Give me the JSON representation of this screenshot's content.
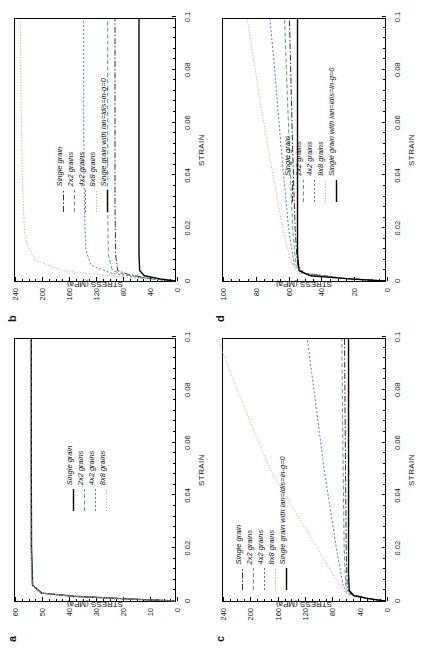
{
  "figure": {
    "orientation": "rotated-90-ccw",
    "panels": [
      "a",
      "b",
      "c",
      "d"
    ]
  },
  "series_styles": {
    "single_grain_solid": {
      "color": "#000000",
      "dash": "none",
      "width": 1.4
    },
    "single_grain_dashdot": {
      "color": "#1a1a1a",
      "dash": "6,2,1.5,2",
      "width": 0.9
    },
    "grains_2x2": {
      "color": "#2f9e5e",
      "dash": "4,2.5",
      "width": 0.9
    },
    "grains_4x2": {
      "color": "#4169c8",
      "dash": "2,2",
      "width": 0.9
    },
    "grains_8x8": {
      "color": "#e8948c",
      "dash": "1.2,1.6",
      "width": 0.9
    },
    "reference_solid": {
      "color": "#000000",
      "dash": "none",
      "width": 1.4
    }
  },
  "chart_data": [
    {
      "panel": "a",
      "type": "line",
      "title": "",
      "xlabel": "STRAIN",
      "ylabel": "STRESS (MPa)",
      "xlim": [
        0,
        0.1
      ],
      "ylim": [
        0,
        60
      ],
      "xticks": [
        0,
        0.02,
        0.04,
        0.06,
        0.08,
        0.1
      ],
      "xticklabels": [
        "0",
        "0.02",
        "0.04",
        "0.06",
        "0.08",
        "0.1"
      ],
      "yticks": [
        0,
        10,
        20,
        30,
        40,
        50,
        60
      ],
      "yticklabels": [
        "0",
        "10",
        "20",
        "30",
        "40",
        "50",
        "60"
      ],
      "grid": false,
      "legend_position": "center",
      "series": [
        {
          "name": "Single grain",
          "style": "single_grain_solid",
          "x": [
            0,
            0.0008,
            0.0018,
            0.003,
            0.006,
            0.02,
            0.05,
            0.08,
            0.1
          ],
          "y": [
            0,
            18,
            38,
            50,
            53.4,
            53.8,
            53.9,
            53.9,
            53.9
          ]
        },
        {
          "name": "2x2 grains",
          "style": "grains_2x2",
          "x": [
            0,
            0.0008,
            0.0018,
            0.003,
            0.006,
            0.02,
            0.05,
            0.08,
            0.1
          ],
          "y": [
            0,
            18,
            38,
            50,
            53.5,
            53.9,
            54.0,
            54.0,
            54.0
          ]
        },
        {
          "name": "4x2 grains",
          "style": "grains_4x2",
          "x": [
            0,
            0.0008,
            0.0018,
            0.003,
            0.006,
            0.02,
            0.05,
            0.08,
            0.1
          ],
          "y": [
            0,
            18,
            38,
            50,
            53.5,
            54.0,
            54.1,
            54.1,
            54.1
          ]
        },
        {
          "name": "8x8 grains",
          "style": "grains_8x8",
          "x": [
            0,
            0.0008,
            0.0018,
            0.003,
            0.006,
            0.02,
            0.05,
            0.08,
            0.1
          ],
          "y": [
            0,
            18,
            38,
            50,
            53.6,
            54.1,
            54.2,
            54.2,
            54.2
          ]
        }
      ]
    },
    {
      "panel": "b",
      "type": "line",
      "title": "",
      "xlabel": "STRAIN",
      "ylabel": "STRESS (MPa)",
      "xlim": [
        0,
        0.1
      ],
      "ylim": [
        0,
        240
      ],
      "xticks": [
        0,
        0.02,
        0.04,
        0.06,
        0.08,
        0.1
      ],
      "xticklabels": [
        "0",
        "0.02",
        "0.04",
        "0.06",
        "0.08",
        "0.1"
      ],
      "yticks": [
        0,
        40,
        80,
        120,
        160,
        200,
        240
      ],
      "yticklabels": [
        "0",
        "40",
        "80",
        "120",
        "160",
        "200",
        "240"
      ],
      "grid": false,
      "legend_position": "center-left",
      "series": [
        {
          "name": "Single grain",
          "style": "single_grain_dashdot",
          "x": [
            0,
            0.001,
            0.0025,
            0.004,
            0.01,
            0.03,
            0.06,
            0.1
          ],
          "y": [
            0,
            40,
            70,
            86,
            89,
            90,
            90,
            90
          ]
        },
        {
          "name": "2x2 grains",
          "style": "grains_2x2",
          "x": [
            0,
            0.001,
            0.0025,
            0.004,
            0.01,
            0.03,
            0.06,
            0.1
          ],
          "y": [
            0,
            42,
            76,
            94,
            100,
            101,
            101,
            101
          ]
        },
        {
          "name": "4x2 grains",
          "style": "grains_4x2",
          "x": [
            0,
            0.001,
            0.003,
            0.006,
            0.012,
            0.03,
            0.06,
            0.1
          ],
          "y": [
            0,
            46,
            96,
            126,
            134,
            136,
            137,
            137
          ]
        },
        {
          "name": "8x8 grains",
          "style": "grains_8x8",
          "x": [
            0,
            0.0015,
            0.004,
            0.008,
            0.014,
            0.02,
            0.04,
            0.07,
            0.1
          ],
          "y": [
            0,
            80,
            170,
            210,
            222,
            226,
            229,
            231,
            232
          ]
        },
        {
          "name": "Single grain with lan=ldis=ln-g=0",
          "style": "reference_solid",
          "x": [
            0,
            0.0008,
            0.002,
            0.004,
            0.01,
            0.05,
            0.1
          ],
          "y": [
            0,
            22,
            46,
            53,
            54,
            54,
            54
          ]
        }
      ]
    },
    {
      "panel": "c",
      "type": "line",
      "title": "",
      "xlabel": "STRAIN",
      "ylabel": "STRESS (MPa)",
      "xlim": [
        0,
        0.1
      ],
      "ylim": [
        0,
        240
      ],
      "xticks": [
        0,
        0.02,
        0.04,
        0.06,
        0.08,
        0.1
      ],
      "xticklabels": [
        "0",
        "0.02",
        "0.04",
        "0.06",
        "0.08",
        "0.1"
      ],
      "yticks": [
        0,
        40,
        80,
        120,
        160,
        200,
        240
      ],
      "yticklabels": [
        "0",
        "40",
        "80",
        "120",
        "160",
        "200",
        "240"
      ],
      "grid": false,
      "legend_position": "upper-left",
      "series": [
        {
          "name": "Single grain",
          "style": "single_grain_dashdot",
          "x": [
            0,
            0.001,
            0.0025,
            0.005,
            0.02,
            0.05,
            0.1
          ],
          "y": [
            0,
            25,
            50,
            56,
            57.5,
            58.5,
            60
          ]
        },
        {
          "name": "2x2 grains",
          "style": "grains_2x2",
          "x": [
            0,
            0.001,
            0.0025,
            0.005,
            0.02,
            0.05,
            0.1
          ],
          "y": [
            0,
            26,
            52,
            58,
            60.5,
            62,
            64
          ]
        },
        {
          "name": "4x2 grains",
          "style": "grains_4x2",
          "x": [
            0,
            0.001,
            0.0028,
            0.006,
            0.02,
            0.05,
            0.08,
            0.1
          ],
          "y": [
            0,
            28,
            56,
            62,
            72,
            90,
            105,
            115
          ]
        },
        {
          "name": "8x8 grains",
          "style": "grains_8x8",
          "x": [
            0,
            0.0012,
            0.003,
            0.008,
            0.02,
            0.05,
            0.08,
            0.1
          ],
          "y": [
            0,
            30,
            58,
            72,
            100,
            170,
            218,
            248
          ]
        },
        {
          "name": "Single grain with lan=ldis=ln-g=0",
          "style": "reference_solid",
          "x": [
            0,
            0.0008,
            0.002,
            0.004,
            0.01,
            0.05,
            0.1
          ],
          "y": [
            0,
            22,
            46,
            53,
            54,
            54,
            54
          ]
        }
      ]
    },
    {
      "panel": "d",
      "type": "line",
      "title": "",
      "xlabel": "STRAIN",
      "ylabel": "STRESS (MPa)",
      "xlim": [
        0,
        0.1
      ],
      "ylim": [
        0,
        100
      ],
      "xticks": [
        0,
        0.02,
        0.04,
        0.06,
        0.08,
        0.1
      ],
      "xticklabels": [
        "0",
        "0.02",
        "0.04",
        "0.06",
        "0.08",
        "0.1"
      ],
      "yticks": [
        0,
        20,
        40,
        60,
        80,
        100
      ],
      "yticklabels": [
        "0",
        "20",
        "40",
        "60",
        "80",
        "100"
      ],
      "grid": false,
      "legend_position": "center",
      "series": [
        {
          "name": "Single grain",
          "style": "single_grain_dashdot",
          "x": [
            0,
            0.001,
            0.003,
            0.006,
            0.02,
            0.05,
            0.1
          ],
          "y": [
            0,
            25,
            50,
            54,
            55.5,
            57,
            59
          ]
        },
        {
          "name": "2x2 grains",
          "style": "grains_2x2",
          "x": [
            0,
            0.001,
            0.003,
            0.006,
            0.02,
            0.05,
            0.1
          ],
          "y": [
            0,
            25,
            51,
            55,
            57,
            59,
            62
          ]
        },
        {
          "name": "4x2 grains",
          "style": "grains_4x2",
          "x": [
            0,
            0.001,
            0.003,
            0.006,
            0.02,
            0.05,
            0.08,
            0.1
          ],
          "y": [
            0,
            26,
            52,
            56,
            59.5,
            64,
            68,
            71
          ]
        },
        {
          "name": "8x8 grains",
          "style": "grains_8x8",
          "x": [
            0,
            0.0012,
            0.003,
            0.007,
            0.02,
            0.05,
            0.08,
            0.1
          ],
          "y": [
            0,
            27,
            54,
            58,
            63,
            72,
            80,
            85
          ]
        },
        {
          "name": "Single grain with lan=ldis=ln-g=0",
          "style": "reference_solid",
          "x": [
            0,
            0.0008,
            0.002,
            0.004,
            0.01,
            0.05,
            0.1
          ],
          "y": [
            0,
            22,
            46,
            53,
            54,
            54,
            54
          ]
        }
      ]
    }
  ]
}
